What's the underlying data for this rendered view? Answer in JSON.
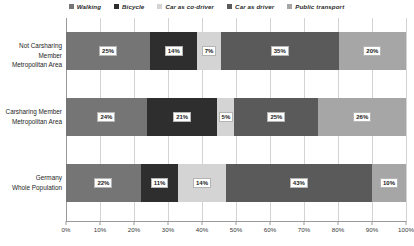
{
  "chart_data": {
    "type": "bar",
    "orientation": "horizontal",
    "stacked": true,
    "normalized": "100%",
    "title": "",
    "xlabel": "",
    "ylabel": "",
    "xlim": [
      0,
      100
    ],
    "grid": true,
    "legend_position": "top-center",
    "categories": [
      "Not Carsharing Member Metropolitan Area",
      "Carsharing Member Metropolitan Area",
      "Germany Whole Population"
    ],
    "category_lines": [
      [
        "Not Carsharing Member",
        "Metropolitan Area"
      ],
      [
        "Carsharing Member",
        "Metropolitan Area"
      ],
      [
        "Germany",
        "Whole Population"
      ]
    ],
    "xticks": [
      "0%",
      "10%",
      "20%",
      "30%",
      "40%",
      "50%",
      "60%",
      "70%",
      "80%",
      "90%",
      "100%"
    ],
    "xtick_values": [
      0,
      10,
      20,
      30,
      40,
      50,
      60,
      70,
      80,
      90,
      100
    ],
    "series": [
      {
        "name": "Walking",
        "color": "#757575",
        "values": [
          25,
          24,
          22
        ],
        "labels": [
          "25%",
          "24%",
          "22%"
        ]
      },
      {
        "name": "Bicycle",
        "color": "#2e2e2e",
        "values": [
          14,
          21,
          11
        ],
        "labels": [
          "14%",
          "21%",
          "11%"
        ]
      },
      {
        "name": "Car as co-driver",
        "color": "#d4d4d4",
        "values": [
          7,
          5,
          14
        ],
        "labels": [
          "7%",
          "5%",
          "14%"
        ]
      },
      {
        "name": "Car as driver",
        "color": "#5a5a5a",
        "values": [
          35,
          25,
          43
        ],
        "labels": [
          "35%",
          "25%",
          "43%"
        ]
      },
      {
        "name": "Public transport",
        "color": "#a6a6a6",
        "values": [
          20,
          26,
          10
        ],
        "labels": [
          "20%",
          "26%",
          "10%"
        ]
      }
    ]
  },
  "legend": {
    "items": [
      {
        "label": "Walking",
        "swatch": "legend-swatch-walking",
        "color": "#757575"
      },
      {
        "label": "Bicycle",
        "swatch": "legend-swatch-bicycle",
        "color": "#2e2e2e"
      },
      {
        "label": "Car as co-driver",
        "swatch": "legend-swatch-car-as-co-driver",
        "color": "#d4d4d4"
      },
      {
        "label": "Car as driver",
        "swatch": "legend-swatch-car-as-driver",
        "color": "#5a5a5a"
      },
      {
        "label": "Public transport",
        "swatch": "legend-swatch-public-transport",
        "color": "#a6a6a6"
      }
    ]
  },
  "axis": {
    "gridline_color": "#d3d3d3",
    "axis_color": "#9a9a9a"
  }
}
